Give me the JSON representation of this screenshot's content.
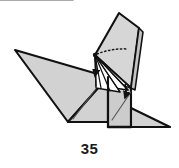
{
  "figure": {
    "kind": "origami-folding-diagram",
    "step_number": "35",
    "colors": {
      "paper_front": "#d2d2d2",
      "paper_back": "#ffffff",
      "outline": "#111111",
      "crease_line": "#555555",
      "dotted_hidden_fold": "#1a1a1a",
      "arrow": "#111111",
      "background": "#ffffff",
      "label_text": "#1a1a1a"
    },
    "shapes": {
      "tail_wing": {
        "label": "long-tail-triangle",
        "fill": "paper_front",
        "points": "15,50 108,77 68,122"
      },
      "left_body": {
        "label": "left-body-panel",
        "fill": "paper_front",
        "points": "68,122 108,77 108,122"
      },
      "center_body": {
        "label": "center-body-panel",
        "fill": "paper_front",
        "points": "108,77 131,88 131,127 108,127"
      },
      "head_flap": {
        "label": "raised-head-flap",
        "fill": "paper_front",
        "points": "95,55 119,13 139,28 131,88"
      },
      "neck_edge": {
        "label": "neck-right-edge-strip",
        "fill": "paper_front",
        "points": "139,28 143,32 135,90 131,88"
      },
      "foot_flap": {
        "label": "right-foot-flap",
        "fill": "paper_front",
        "points": "131,108 170,127 131,127"
      },
      "white_wedge_a": {
        "label": "white-back-wedge-upper",
        "fill": "paper_back",
        "points": "95,55 131,88 104,79"
      },
      "white_wedge_b": {
        "label": "white-back-wedge-lower",
        "fill": "paper_back",
        "points": "95,55 128,90 100,86"
      },
      "white_wedge_c": {
        "label": "white-back-wedge-bottom",
        "fill": "paper_back",
        "points": "95,55 120,92 96,88"
      }
    },
    "creases": [
      {
        "label": "tail-inner-crease",
        "x1": 73,
        "y1": 119,
        "x2": 95,
        "y2": 90
      },
      {
        "label": "center-body-crease",
        "x1": 112,
        "y1": 120,
        "x2": 131,
        "y2": 92
      },
      {
        "label": "body-fold-vertical",
        "x1": 108,
        "y1": 77,
        "x2": 108,
        "y2": 127
      }
    ],
    "dotted_fold": {
      "label": "hidden-fold-dotted-arc",
      "path": "M 97,54 Q 112,48 128,49"
    },
    "fan_lines": {
      "label": "fan-of-fold-lines-from-apex",
      "apex": {
        "x": 95,
        "y": 55
      },
      "endpoints": [
        {
          "x": 131,
          "y": 88
        },
        {
          "x": 128,
          "y": 90
        },
        {
          "x": 120,
          "y": 92
        },
        {
          "x": 104,
          "y": 79
        },
        {
          "x": 100,
          "y": 86
        },
        {
          "x": 96,
          "y": 88
        }
      ]
    },
    "arrows": [
      {
        "label": "fold-down-arrow-left",
        "direction": "down",
        "path": "M 95,57 Q 97,66 95,76",
        "tip": {
          "x": 95,
          "y": 80
        }
      },
      {
        "label": "fold-down-arrow-right",
        "direction": "down",
        "path": "M 125,84 Q 127,92 125,98",
        "tip": {
          "x": 125,
          "y": 103
        }
      }
    ]
  }
}
